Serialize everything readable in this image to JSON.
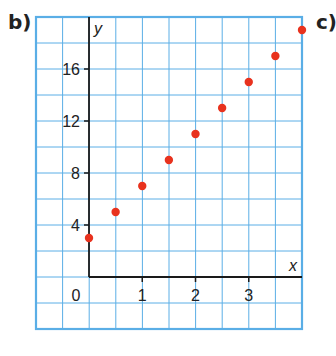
{
  "labels": {
    "left": "b)",
    "right": "c)"
  },
  "chart_data": {
    "type": "scatter",
    "title": "",
    "xlabel": "x",
    "ylabel": "y",
    "x": [
      0,
      0.5,
      1,
      1.5,
      2,
      2.5,
      3,
      3.5,
      4
    ],
    "y": [
      3,
      5,
      7,
      9,
      11,
      13,
      15,
      17,
      19
    ],
    "xticks": [
      1,
      2,
      3
    ],
    "yticks": [
      4,
      8,
      12,
      16
    ],
    "origin_label": "0",
    "xlim": [
      -1,
      4
    ],
    "ylim": [
      -4,
      20
    ],
    "grid": true,
    "point_color": "#e8321e",
    "grid_color": "#5aaee6",
    "axis_color": "#1a1a1a"
  }
}
